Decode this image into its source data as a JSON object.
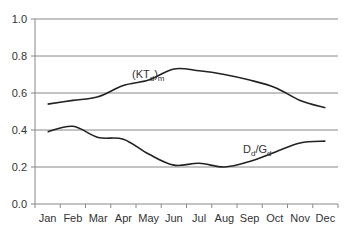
{
  "chart_data": {
    "type": "line",
    "title": "",
    "xlabel": "",
    "ylabel": "",
    "categories": [
      "Jan",
      "Feb",
      "Mar",
      "Apr",
      "May",
      "Jun",
      "Jul",
      "Aug",
      "Sep",
      "Oct",
      "Nov",
      "Dec"
    ],
    "y_ticks": [
      "0.0",
      "0.2",
      "0.4",
      "0.6",
      "0.8",
      "1.0"
    ],
    "ylim": [
      0,
      1.0
    ],
    "grid": true,
    "series": [
      {
        "name": "(KTd)m",
        "label_main": "(KT",
        "label_sub": "d",
        "label_tail": ")",
        "label_sub2": "m",
        "values": [
          0.54,
          0.56,
          0.58,
          0.64,
          0.67,
          0.73,
          0.72,
          0.7,
          0.67,
          0.63,
          0.56,
          0.52
        ]
      },
      {
        "name": "Dd/Gd",
        "label_main": "D",
        "label_sub": "d",
        "label_tail": "/G",
        "label_sub2": "d",
        "values": [
          0.39,
          0.42,
          0.36,
          0.35,
          0.27,
          0.21,
          0.22,
          0.2,
          0.23,
          0.28,
          0.33,
          0.34
        ]
      }
    ],
    "colors": {
      "line": "#222222",
      "grid": "#888888",
      "axis": "#888888"
    }
  }
}
